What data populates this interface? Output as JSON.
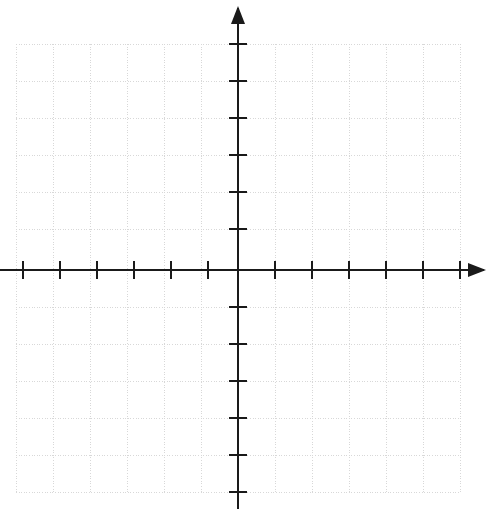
{
  "chart_data": {
    "type": "scatter",
    "title": "",
    "subtitle": "",
    "xlabel": "",
    "ylabel": "",
    "x": [],
    "y": [],
    "series": [],
    "annotations": [],
    "legend": {
      "entries": [],
      "position": "none",
      "visible": false
    },
    "grid": {
      "visible": true,
      "style": "dotted",
      "color": "#d8d8d8",
      "cell_size_px": 37,
      "x_lines": [
        16,
        53,
        90,
        127,
        164,
        201,
        238,
        275,
        312,
        349,
        386,
        423,
        460
      ],
      "y_lines": [
        44,
        81,
        118,
        155,
        192,
        229,
        270,
        307,
        344,
        381,
        418,
        455,
        492
      ]
    },
    "axes": {
      "color": "#1a1a1a",
      "origin_px": {
        "x": 238,
        "y": 270
      },
      "x_axis": {
        "visible": true,
        "start_px": 0,
        "end_px": 484,
        "arrow_start": false,
        "arrow_end": true,
        "tick_labels": [],
        "ticks_px": [
          23,
          60,
          97,
          134,
          171,
          208,
          275,
          312,
          349,
          386,
          423,
          460
        ],
        "tick_length_px": 18
      },
      "y_axis": {
        "visible": true,
        "start_px": 8,
        "end_px": 509,
        "arrow_start": true,
        "arrow_end": false,
        "tick_labels": [],
        "ticks_px": [
          44,
          81,
          118,
          155,
          192,
          229,
          307,
          344,
          381,
          418,
          455,
          492
        ],
        "tick_length_px": 18
      }
    },
    "xlim": [
      -6.5,
      6.5
    ],
    "ylim": [
      -6.5,
      6.5
    ],
    "tick_counts": {
      "x_negative": 6,
      "x_positive": 6,
      "y_negative": 6,
      "y_positive": 6
    }
  },
  "colors": {
    "background": "#ffffff",
    "axis": "#1a1a1a",
    "grid": "#d8d8d8"
  }
}
